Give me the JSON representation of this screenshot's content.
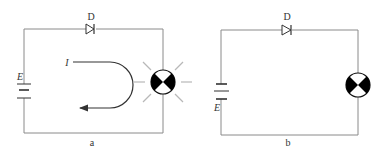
{
  "diagram": {
    "panels": [
      {
        "id": "a",
        "caption": "a",
        "diode_label": "D",
        "source_label": "E",
        "current_label": "I",
        "lamp_state": "lit",
        "battery_orientation": "label-above"
      },
      {
        "id": "b",
        "caption": "b",
        "diode_label": "D",
        "source_label": "E",
        "lamp_state": "unlit",
        "battery_orientation": "label-below"
      }
    ],
    "colors": {
      "wire": "#8a8a8a",
      "symbol": "#000000",
      "glow": "#b8b8b8"
    }
  }
}
